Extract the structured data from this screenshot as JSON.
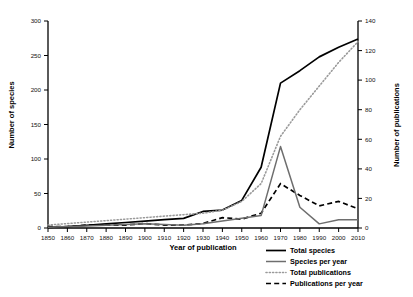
{
  "chart_data": {
    "type": "line",
    "title": "",
    "xlabel": "Year of publication",
    "ylabel": "Number of species",
    "ylabel_right": "Number of publications",
    "xlim": [
      1850,
      2010
    ],
    "ylim": [
      0,
      300
    ],
    "ylim_right": [
      0,
      140
    ],
    "grid": false,
    "legend_position": "bottom-right",
    "xticks": [
      1850,
      1860,
      1870,
      1880,
      1890,
      1900,
      1910,
      1920,
      1930,
      1940,
      1950,
      1960,
      1970,
      1980,
      1990,
      2000,
      2010
    ],
    "yticks": [
      0,
      50,
      100,
      150,
      200,
      250,
      300
    ],
    "yticks_right": [
      0,
      20,
      40,
      60,
      80,
      100,
      120,
      140
    ],
    "x": [
      1850,
      1860,
      1870,
      1880,
      1890,
      1900,
      1910,
      1920,
      1930,
      1940,
      1950,
      1960,
      1970,
      1980,
      1990,
      2000,
      2010
    ],
    "series": [
      {
        "name": "Total species",
        "axis": "left",
        "style": "solid",
        "color": "#000000",
        "values": [
          1,
          2,
          4,
          6,
          8,
          10,
          12,
          14,
          24,
          26,
          40,
          88,
          210,
          228,
          248,
          262,
          274
        ]
      },
      {
        "name": "Species per year",
        "axis": "left",
        "style": "solid",
        "color": "#6e6e6e",
        "values": [
          1,
          2,
          3,
          4,
          5,
          6,
          5,
          4,
          6,
          10,
          14,
          18,
          118,
          30,
          6,
          12,
          12
        ]
      },
      {
        "name": "Total publications",
        "axis": "right",
        "style": "dotted",
        "color": "#9a9a9a",
        "values": [
          2,
          3,
          4,
          5,
          6,
          7,
          8,
          9,
          10,
          12,
          18,
          30,
          62,
          80,
          96,
          112,
          126
        ]
      },
      {
        "name": "Publications per year",
        "axis": "right",
        "style": "dashed",
        "color": "#000000",
        "values": [
          1,
          1,
          2,
          2,
          2,
          3,
          2,
          2,
          3,
          7,
          6,
          10,
          30,
          22,
          15,
          18,
          13
        ]
      }
    ]
  },
  "legend": {
    "items": [
      {
        "label": "Total species"
      },
      {
        "label": "Species per year"
      },
      {
        "label": "Total publications"
      },
      {
        "label": "Publications per year"
      }
    ]
  }
}
